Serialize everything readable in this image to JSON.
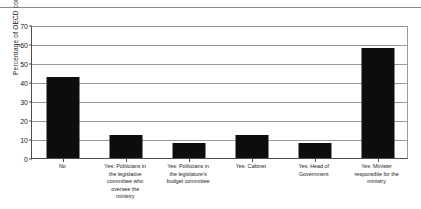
{
  "chart_data": {
    "type": "bar",
    "title": "",
    "xlabel": "",
    "ylabel": "Percentage of OECD countries",
    "ylim": [
      0,
      70
    ],
    "ytick_step": 10,
    "yticks": [
      "0",
      "10",
      "20",
      "30",
      "40",
      "50",
      "60",
      "70"
    ],
    "grid": true,
    "legend": "none",
    "bar_color": "#0d0d0d",
    "categories": [
      "No",
      "Yes: Politicians in the legislative committee who oversee the ministry",
      "Yes: Politicians in the legislature's budget committee",
      "Yes: Cabinet",
      "Yes: Head of Government",
      "Yes: Minister responsible for the ministry"
    ],
    "category_lines": [
      [
        "No"
      ],
      [
        "Yes: Politicians in",
        "the legislative",
        "committee who",
        "oversee the",
        "ministry"
      ],
      [
        "Yes: Politicians in",
        "the legislature's",
        "budget committee"
      ],
      [
        "Yes: Cabinet"
      ],
      [
        "Yes: Head of",
        "Government"
      ],
      [
        "Yes: Minister",
        "responsible for the",
        "ministry"
      ]
    ],
    "values": [
      42.5,
      12,
      8,
      12,
      8,
      58
    ]
  }
}
